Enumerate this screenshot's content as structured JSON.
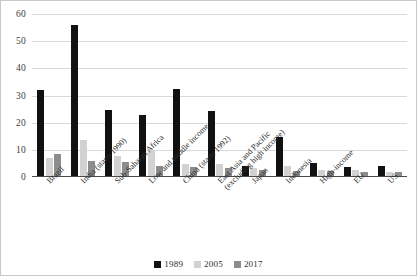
{
  "chart_data": {
    "type": "bar",
    "title": "",
    "xlabel": "",
    "ylabel": "",
    "ylim": [
      0,
      60
    ],
    "yticks": [
      0,
      10,
      20,
      30,
      40,
      50,
      60
    ],
    "grid": true,
    "legend_position": "bottom",
    "categories": [
      "Brazil",
      "India (starts 1990)",
      "Sub-Saharan Africa",
      "Low and middle income",
      "China (starts 1992)",
      "East Asia and Pacific (excluding high income)",
      "Japan",
      "Indonesia",
      "High-income",
      "EU",
      "US"
    ],
    "category_lines": [
      [
        "Brazil",
        ""
      ],
      [
        "India (starts 1990)",
        ""
      ],
      [
        "Sub-Saharan Africa",
        ""
      ],
      [
        "Low and middle income",
        ""
      ],
      [
        "China (starts 1992)",
        ""
      ],
      [
        "East Asia and Pacific",
        "(excluding high income)"
      ],
      [
        "Japan",
        ""
      ],
      [
        "Indonesia",
        ""
      ],
      [
        "High-income",
        ""
      ],
      [
        "EU",
        ""
      ],
      [
        "US",
        ""
      ]
    ],
    "series": [
      {
        "name": "1989",
        "color": "#111111",
        "values": [
          32,
          56,
          24.6,
          23,
          32.3,
          24.3,
          4,
          14.7,
          5.1,
          3.8,
          4.2
        ]
      },
      {
        "name": "2005",
        "color": "#d2d2d2",
        "values": [
          7,
          13.7,
          7.8,
          10,
          4.7,
          4.8,
          3.5,
          4.1,
          2.5,
          2.4,
          1.8
        ]
      },
      {
        "name": "2017",
        "color": "#8c8c8c",
        "values": [
          8.5,
          5.9,
          5.7,
          4.2,
          3.8,
          3.4,
          2.6,
          2.2,
          2.2,
          2,
          1.9
        ]
      }
    ]
  },
  "legend": {
    "items": [
      {
        "label": "1989",
        "color": "#111111"
      },
      {
        "label": "2005",
        "color": "#d2d2d2"
      },
      {
        "label": "2017",
        "color": "#8c8c8c"
      }
    ]
  }
}
